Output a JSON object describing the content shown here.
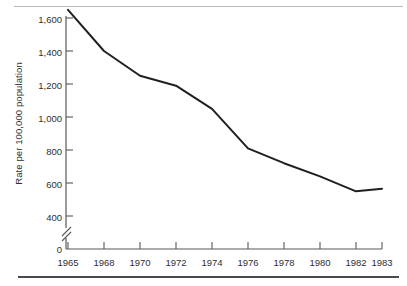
{
  "figure": {
    "name": "line-chart-figure",
    "top_rule_color": "#b9b9bb",
    "bottom_rule_color": "#4a4a4c"
  },
  "chart_data": {
    "type": "line",
    "title": "",
    "subtitle": "",
    "xlabel": "",
    "ylabel": "Rate per 100,000 population",
    "categories": [
      "1965",
      "1968",
      "1970",
      "1972",
      "1974",
      "1976",
      "1978",
      "1980",
      "1982",
      "1983"
    ],
    "x": [
      1965,
      1968,
      1970,
      1972,
      1974,
      1976,
      1978,
      1980,
      1982,
      1983
    ],
    "values": [
      1650,
      1400,
      1250,
      1190,
      1050,
      810,
      720,
      640,
      550,
      565
    ],
    "series": [
      {
        "name": "Rate per 100,000 population",
        "values": [
          1650,
          1400,
          1250,
          1190,
          1050,
          810,
          720,
          640,
          550,
          565
        ]
      }
    ],
    "ylim": [
      0,
      1700
    ],
    "y_ticks": [
      "0",
      "400",
      "600",
      "800",
      "1,000",
      "1,200",
      "1,400",
      "1,600"
    ],
    "y_tick_values": [
      0,
      400,
      600,
      800,
      1000,
      1200,
      1400,
      1600
    ],
    "axis_break": {
      "present": true,
      "between": [
        0,
        400
      ],
      "symbol": "double-slash"
    },
    "grid": false,
    "legend": null,
    "legend_position": "none",
    "line_color": "#231f20",
    "line_width": 2,
    "markers": false,
    "annotations": []
  },
  "axes": {
    "y_axis_title": "Rate per 100,000 population",
    "y_tick_labels": [
      "1,600",
      "1,400",
      "1,200",
      "1,000",
      "800",
      "600",
      "400",
      "0"
    ],
    "x_tick_labels": [
      "1965",
      "1968",
      "1970",
      "1972",
      "1974",
      "1976",
      "1978",
      "1980",
      "1982",
      "1983"
    ]
  }
}
